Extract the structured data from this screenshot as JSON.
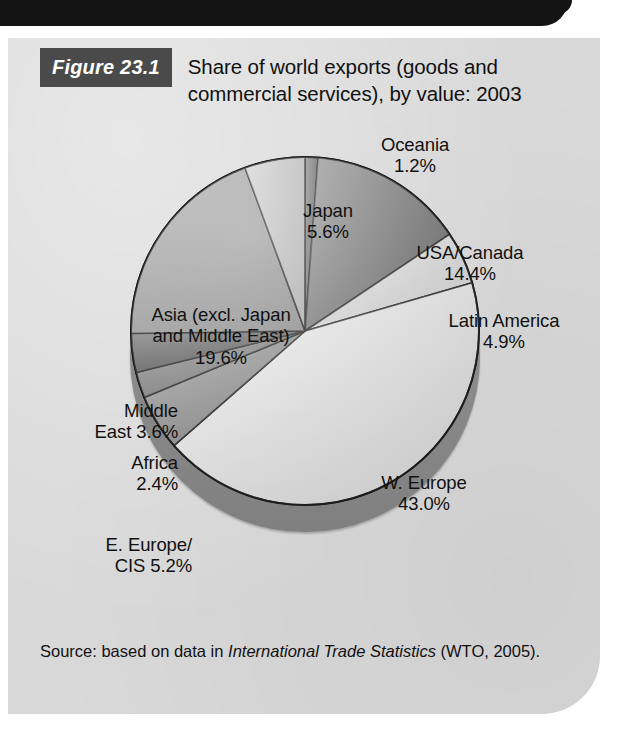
{
  "figure": {
    "tag": "Figure 23.1",
    "title": "Share of world exports (goods and commercial services), by value: 2003",
    "source_prefix": "Source: based on data in ",
    "source_italic": "International Trade Statistics",
    "source_suffix": " (WTO, 2005)."
  },
  "labels": {
    "oceania": "Oceania\n1.2%",
    "japan": "Japan\n5.6%",
    "usa": "USA/Canada\n14.4%",
    "latin": "Latin America\n4.9%",
    "asia": "Asia (excl. Japan\nand Middle East)\n19.6%",
    "middle_east": "Middle\nEast 3.6%",
    "africa": "Africa\n2.4%",
    "e_europe": "E. Europe/\nCIS 5.2%",
    "w_europe": "W. Europe\n43.0%"
  },
  "chart_data": {
    "type": "pie",
    "title": "Share of world exports (goods and commercial services), by value: 2003",
    "subtitle": "",
    "unit": "percent of world exports",
    "value_suffix": "%",
    "start_angle_deg": 0,
    "direction": "clockwise",
    "three_d": true,
    "legend": "none (slice callout labels)",
    "grid": false,
    "total": 100.0,
    "categories": [
      "Oceania",
      "USA/Canada",
      "Latin America",
      "W. Europe",
      "E. Europe/CIS",
      "Africa",
      "Middle East",
      "Asia (excl. Japan and Middle East)",
      "Japan"
    ],
    "values": [
      1.2,
      14.4,
      4.9,
      43.0,
      5.2,
      2.4,
      3.6,
      19.6,
      5.6
    ],
    "slice_colors": [
      "#5e5e5e",
      "#727272",
      "#e4e4e4",
      "#f0f0f0",
      "#ececec",
      "#8c8c8c",
      "#7a7a7a",
      "#565656",
      "#9a9a9a",
      "#c2c2c2"
    ],
    "slices": [
      {
        "label": "Oceania",
        "value": 1.2,
        "display": "1.2%",
        "color": "#5e5e5e"
      },
      {
        "label": "USA/Canada",
        "value": 14.4,
        "display": "14.4%",
        "color": "#6e6e6e"
      },
      {
        "label": "Latin America",
        "value": 4.9,
        "display": "4.9%",
        "color": "#e6e6e6"
      },
      {
        "label": "W. Europe",
        "value": 43.0,
        "display": "43.0%",
        "color": "#f2f2f2"
      },
      {
        "label": "E. Europe/CIS",
        "value": 5.2,
        "display": "5.2%",
        "color": "#8f8f8f"
      },
      {
        "label": "Africa",
        "value": 2.4,
        "display": "2.4%",
        "color": "#7d7d7d"
      },
      {
        "label": "Middle East",
        "value": 3.6,
        "display": "3.6%",
        "color": "#565656"
      },
      {
        "label": "Asia (excl. Japan and Middle East)",
        "value": 19.6,
        "display": "19.6%",
        "color": "#9d9d9d"
      },
      {
        "label": "Japan",
        "value": 5.6,
        "display": "5.6%",
        "color": "#c6c6c6"
      }
    ],
    "colors": {
      "panel_background": "#d9d9d9",
      "figure_tag_background": "#4a4a4a",
      "pie_base": "#8e8e8e",
      "outline": "#1a1a1a",
      "text": "#111111"
    }
  }
}
